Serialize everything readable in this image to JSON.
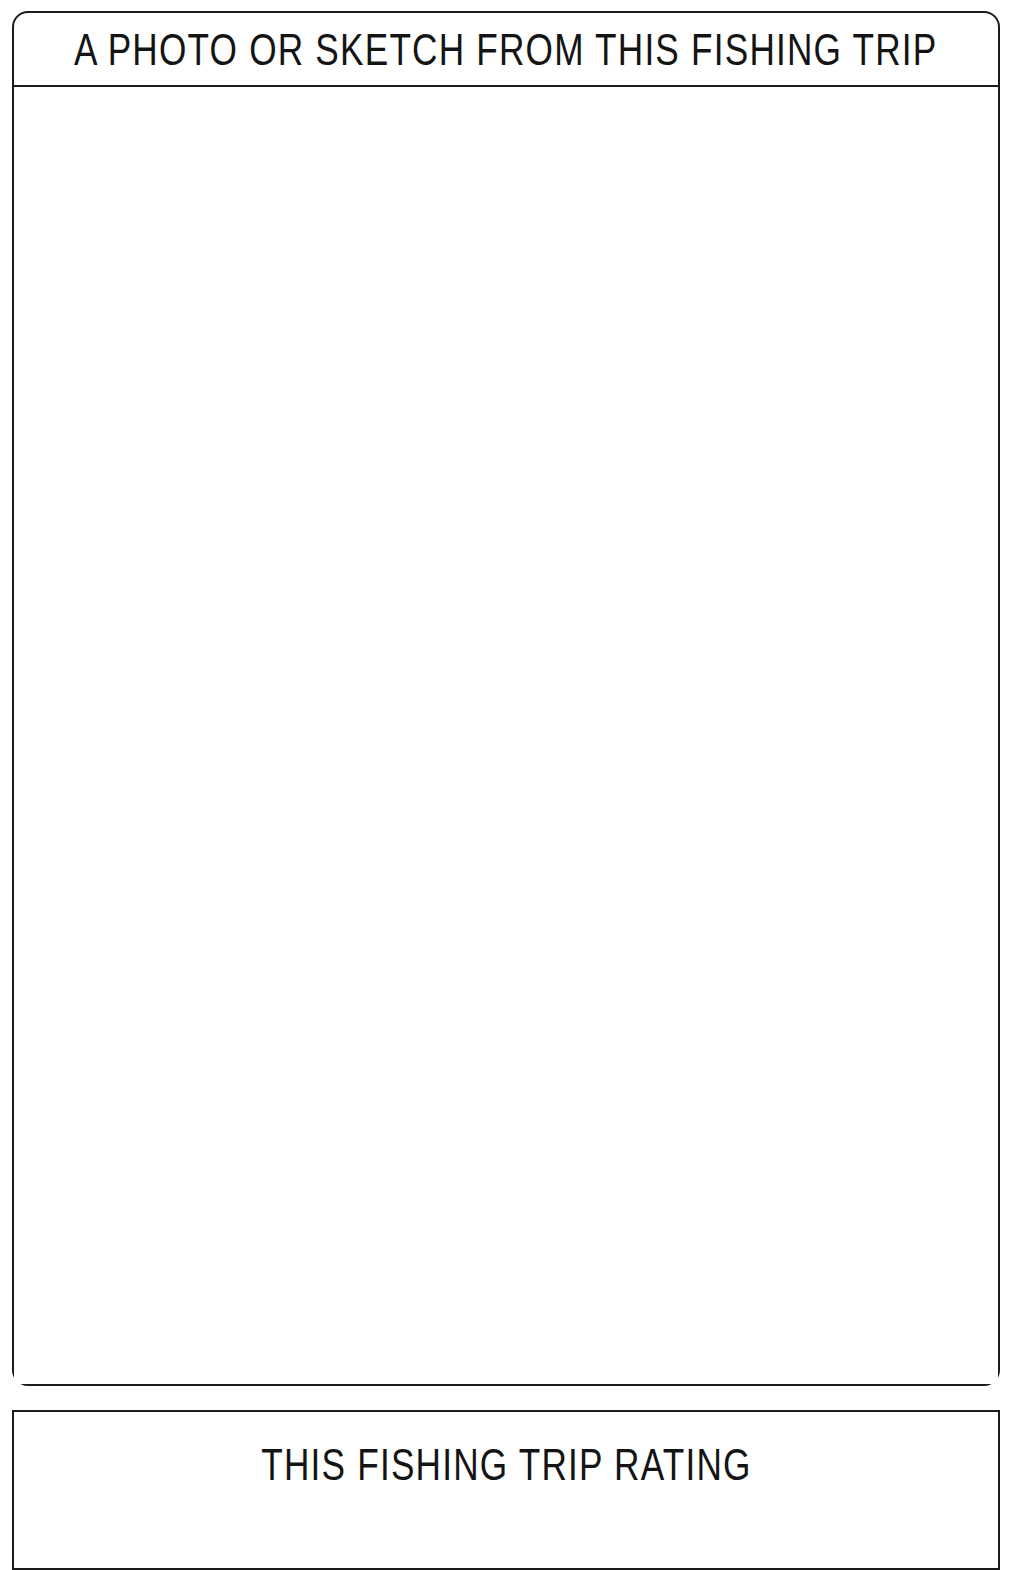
{
  "page": {
    "background_color": "#ffffff",
    "ink_color": "#1b1b1b",
    "text_color": "#141414"
  },
  "photo_panel": {
    "title": "A PHOTO OR SKETCH FROM THIS FISHING TRIP",
    "body_placeholder": ""
  },
  "rating_panel": {
    "title": "THIS FISHING TRIP RATING"
  }
}
